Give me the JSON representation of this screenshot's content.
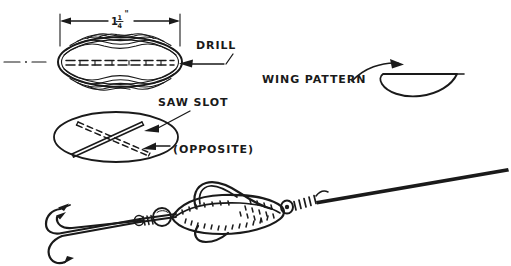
{
  "figure": {
    "background_color": "#ffffff",
    "ink_color": "#1a1a1a",
    "width": 511,
    "height": 266
  },
  "labels": {
    "dimension_whole": "1",
    "dimension_numerator": "1",
    "dimension_denominator": "4",
    "dimension_unit": "\"",
    "dimension_full": "1 1/4\"",
    "drill": "DRILL",
    "saw_slot": "SAW SLOT",
    "opposite": "(OPPOSITE)",
    "wing_pattern": "WING PATTERN"
  },
  "views": [
    {
      "id": "top-body-view",
      "name": "Lure body blank, top view with wood grain",
      "dimension": "1 1/4\"",
      "annotations": [
        "DRILL"
      ],
      "features": [
        "wood-grain-rings",
        "dashed-center-slot",
        "centerline-mark"
      ]
    },
    {
      "id": "saw-slot-view",
      "name": "Lure body end view showing saw slots",
      "annotations": [
        "SAW SLOT",
        "(OPPOSITE)"
      ],
      "features": [
        "solid-slot",
        "dashed-slot"
      ]
    },
    {
      "id": "wing-pattern-view",
      "name": "Wing template outline",
      "annotations": [
        "WING PATTERN"
      ],
      "features": [
        "teardrop-wing-outline",
        "curved-leader-arrow"
      ]
    },
    {
      "id": "assembly-view",
      "name": "Completed lure assembly on wire shaft",
      "annotations": [],
      "features": [
        "treble-hook",
        "wire-shaft",
        "bead",
        "stippled-body",
        "wings",
        "coil-wrap",
        "tapered-wire"
      ]
    }
  ]
}
